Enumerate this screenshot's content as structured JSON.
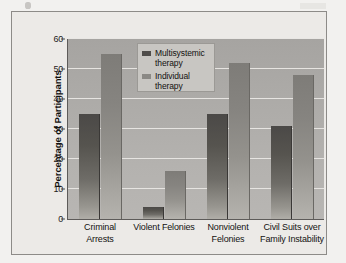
{
  "figure": {
    "frame_border_color": "#8d8b88",
    "plot_background_color": "#b0aeab",
    "gridline_color": "#e9e7e4"
  },
  "legend": {
    "position": "inside-top-center",
    "entries": [
      {
        "label_line1": "Multisystemic",
        "label_line2": "therapy",
        "color": "#4f4d4a",
        "swatch_name": "legend-swatch-multisystemic"
      },
      {
        "label_line1": "Individual",
        "label_line2": "therapy",
        "color": "#8b8985",
        "swatch_name": "legend-swatch-individual"
      }
    ]
  },
  "chart_data": {
    "type": "bar",
    "title": "",
    "subtitle": "",
    "xlabel": "",
    "ylabel": "Percentage of Participants",
    "ylim": [
      0,
      60
    ],
    "yticks": [
      0,
      10,
      20,
      30,
      40,
      50,
      60
    ],
    "ytick_labels": [
      "0",
      "10",
      "20",
      "30",
      "40",
      "50",
      "60"
    ],
    "grid": true,
    "grid_axis": "y",
    "legend_position": "inside top center",
    "categories": [
      "Criminal Arrests",
      "Violent Felonies",
      "Nonviolent Felonies",
      "Civil Suits over Family Instability"
    ],
    "category_label_lines": [
      [
        "Criminal",
        "Arrests"
      ],
      [
        "Violent Felonies",
        ""
      ],
      [
        "Nonviolent",
        "Felonies"
      ],
      [
        "Civil Suits over",
        "Family Instability"
      ]
    ],
    "series": [
      {
        "name": "Multisystemic therapy",
        "color": "#4f4d4a",
        "values": [
          35,
          4,
          35,
          31
        ]
      },
      {
        "name": "Individual therapy",
        "color": "#8b8985",
        "values": [
          55,
          16,
          52,
          48
        ]
      }
    ]
  }
}
